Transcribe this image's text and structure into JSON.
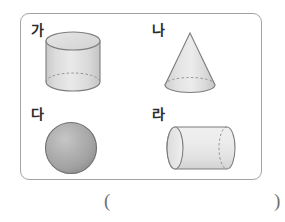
{
  "worksheet": {
    "panel": {
      "border_color": "#a3a3a3",
      "background": "#ffffff"
    },
    "shapes": [
      {
        "label": "가",
        "name": "cylinder-vertical",
        "description": "vertical cylinder",
        "fill": "#e2e2e2",
        "stroke": "#787878"
      },
      {
        "label": "나",
        "name": "cone",
        "description": "cone",
        "fill": "#e4e4e4",
        "stroke": "#787878"
      },
      {
        "label": "다",
        "name": "sphere",
        "description": "sphere",
        "fill": "#a9a9a9",
        "stroke": "#6f6f6f"
      },
      {
        "label": "라",
        "name": "cylinder-horizontal",
        "description": "horizontal cylinder",
        "fill": "#ececec",
        "stroke": "#787878"
      }
    ],
    "answer": {
      "open_paren": "(",
      "close_paren": ")",
      "value": ""
    }
  }
}
